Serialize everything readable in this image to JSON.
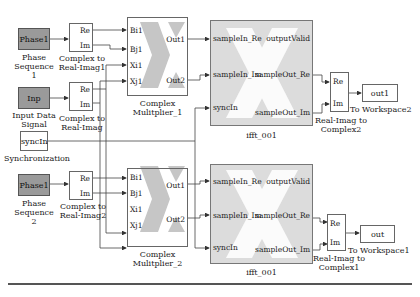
{
  "diagram": {
    "sources": [
      {
        "id": "phase1_top",
        "text": "Phase1",
        "caption_lines": [
          "Phase",
          "Sequence",
          "1"
        ]
      },
      {
        "id": "inp",
        "text": "Inp",
        "caption_lines": [
          "Input Data",
          "Signal"
        ]
      },
      {
        "id": "syncin",
        "text": "syncIn",
        "caption_lines": [
          "Synchronization"
        ]
      },
      {
        "id": "phase1_bottom",
        "text": "Phase1",
        "caption_lines": [
          "Phase",
          "Sequence",
          "2"
        ]
      }
    ],
    "complex_to_real": [
      {
        "id": "c2ri1",
        "ports": [
          "Re",
          "Im"
        ],
        "caption_lines": [
          "Complex to",
          "Real-Imag1"
        ]
      },
      {
        "id": "c2ri",
        "ports": [
          "Re",
          "Im"
        ],
        "caption_lines": [
          "Complex to",
          "Real-Imag"
        ]
      },
      {
        "id": "c2ri2",
        "ports": [
          "Re",
          "Im"
        ],
        "caption_lines": [
          "Complex to",
          "Real-Imag2"
        ]
      }
    ],
    "multipliers": [
      {
        "id": "mult1",
        "in_ports": [
          "Bi1",
          "Bj1",
          "Xi1",
          "Xj1"
        ],
        "out_ports": [
          "Out1",
          "Out2"
        ],
        "caption_lines": [
          "Complex",
          "Mulitplier_1"
        ]
      },
      {
        "id": "mult2",
        "in_ports": [
          "Bi1",
          "Bj1",
          "Xi1",
          "Xj1"
        ],
        "out_ports": [
          "Out1",
          "Out2"
        ],
        "caption_lines": [
          "Complex",
          "Mulitplier_2"
        ]
      }
    ],
    "iffts": [
      {
        "id": "ifft_top",
        "in_ports": [
          "sampleIn_Re",
          "sampleIn_Im",
          "syncIn"
        ],
        "out_ports": [
          "outputValid",
          "sampleOut_Re",
          "sampleOut_Im"
        ],
        "caption": "ifft_001"
      },
      {
        "id": "ifft_bottom",
        "in_ports": [
          "sampleIn_Re",
          "sampleIn_Im",
          "syncIn"
        ],
        "out_ports": [
          "outputValid",
          "sampleOut_Re",
          "sampleOut_Im"
        ],
        "caption": "ifft_001"
      }
    ],
    "real_to_complex": [
      {
        "id": "ri2c2",
        "ports": [
          "Re",
          "Im"
        ],
        "caption_lines": [
          "Real-Imag to",
          "Complex2"
        ]
      },
      {
        "id": "ri2c1",
        "ports": [
          "Re",
          "Im"
        ],
        "caption_lines": [
          "Real-Imag to",
          "Complex1"
        ]
      }
    ],
    "sinks": [
      {
        "id": "ws2",
        "text": "out1",
        "caption": "To Workspace2"
      },
      {
        "id": "ws1",
        "text": "out",
        "caption": "To Workspace1"
      }
    ]
  },
  "colors": {
    "source_fill": "#9a9a9a",
    "xilinx_fill": "#dcdcdc",
    "wire": "#555555"
  }
}
